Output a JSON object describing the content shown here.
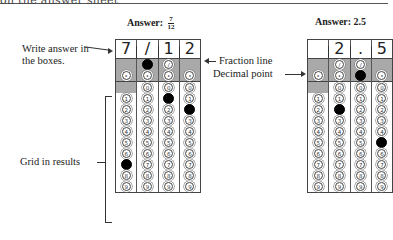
{
  "header": {
    "cut_text": "on the answer sheet"
  },
  "left_example": {
    "title_prefix": "Answer:",
    "fraction": {
      "numerator": "7",
      "denominator": "12"
    },
    "boxes": [
      "7",
      "/",
      "1",
      "2"
    ],
    "fraction_row": [
      null,
      "filled",
      "slash",
      null
    ],
    "decimal_row": [
      "dot",
      "dot",
      "dot",
      "dot"
    ],
    "zero_row": [
      null,
      "0",
      "0",
      "0"
    ],
    "digits": [
      "1",
      "2",
      "3",
      "4",
      "5",
      "6",
      "7",
      "8",
      "9"
    ],
    "filled_digits": [
      "7",
      null,
      "1",
      "2"
    ]
  },
  "right_example": {
    "title": "Answer: 2.5",
    "boxes": [
      "",
      "2",
      ".",
      "5"
    ],
    "fraction_row": [
      null,
      "slash",
      "slash",
      null
    ],
    "decimal_row": [
      "dot",
      "dot",
      "filled",
      "dot"
    ],
    "zero_row": [
      null,
      "0",
      "0",
      "0"
    ],
    "digits": [
      "1",
      "2",
      "3",
      "4",
      "5",
      "6",
      "7",
      "8",
      "9"
    ],
    "filled_digits": [
      null,
      "2",
      null,
      "5"
    ]
  },
  "annotations": {
    "write_answer": "Write answer in the boxes.",
    "fraction_line": "Fraction line",
    "decimal_point": "Decimal point",
    "grid_in_results": "Grid in results"
  }
}
